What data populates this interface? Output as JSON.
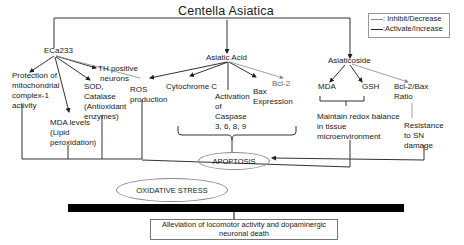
{
  "title": "Centella Asiatica",
  "legend": {
    "items": [
      {
        "label": ": Inhibit/Decrease",
        "color": "#888888"
      },
      {
        "label": ":Activate/Increase",
        "color": "#222222"
      }
    ]
  },
  "branches": {
    "eca233": {
      "label": "ECa233",
      "effects": [
        "Protection of mitochondrial complex-1 activity",
        "TH positive neurons",
        "SOD, Catalase (Antioxidant enzymes)",
        "MDA levels (Lipid peroxidation)",
        "ROS production"
      ]
    },
    "asiatic_acid": {
      "label": "Asiatic Acid",
      "effects": [
        "Cytochrome C",
        "Activation of Caspase 3, 6, 8, 9",
        "Bax Expression",
        "Bcl-2"
      ]
    },
    "asiaticoside": {
      "label": "Asiaticoside",
      "effects": [
        "MDA",
        "GSH",
        "Bcl-2/Bax Ratio",
        "Maintain redox balance in tissue microenvironment",
        "Resistance to SN damage"
      ]
    }
  },
  "labels": {
    "protection_l1": "Protection of",
    "protection_l2": "mitochondrial",
    "protection_l3": "complex-1",
    "protection_l4": "activity",
    "th_l1": "TH positive",
    "th_l2": "neurons",
    "sod_l1": "SOD,",
    "sod_l2": "Catalase",
    "sod_l3": "(Antioxidant",
    "sod_l4": "enzymes)",
    "mda_l1": "MDA levels",
    "mda_l2": "(Lipid",
    "mda_l3": "peroxidation)",
    "ros_l1": "ROS",
    "ros_l2": "production",
    "cytc": "Cytochrome C",
    "casp_l1": "Activation",
    "casp_l2": "of",
    "casp_l3": "Caspase",
    "casp_l4": "3, 6, 8, 9",
    "bax_l1": "Bax",
    "bax_l2": "Expression",
    "bcl2": "Bcl-2",
    "mda2": "MDA",
    "gsh": "GSH",
    "ratio_l1": "Bcl-2/Bax",
    "ratio_l2": "Ratio",
    "redox_l1": "Maintain redox balance",
    "redox_l2": "in tissue",
    "redox_l3": "microenvironment",
    "resist_l1": "Resistance",
    "resist_l2": "to SN",
    "resist_l3": "damage"
  },
  "outcomes": {
    "apoptosis": "APOPTOSIS",
    "oxidative_stress": "OXIDATIVE STRESS",
    "final_l1": "Alleviation of locomotor activity and dopaminergic",
    "final_l2": "neuronal death"
  }
}
